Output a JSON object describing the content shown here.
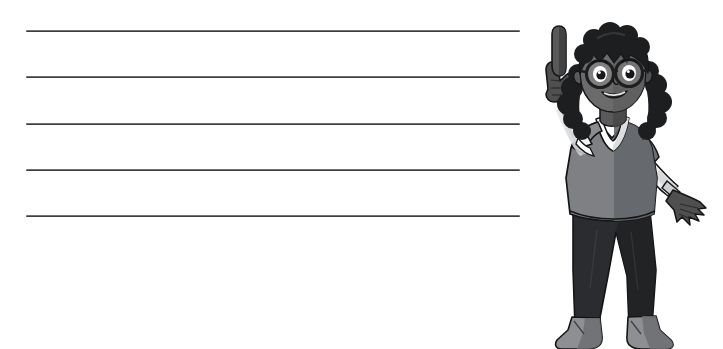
{
  "page": {
    "background_color": "#ffffff",
    "width": 723,
    "height": 349,
    "kind": "worksheet-writing-lines-with-character"
  },
  "worksheet": {
    "lines_label": "",
    "line_count": 5,
    "lines": [
      {
        "index": 1,
        "text": "",
        "y": 30
      },
      {
        "index": 2,
        "text": "",
        "y": 76
      },
      {
        "index": 3,
        "text": "",
        "y": 123
      },
      {
        "index": 4,
        "text": "",
        "y": 169
      },
      {
        "index": 5,
        "text": "",
        "y": 215
      }
    ],
    "line_color": "#3b3d41",
    "line_highlight_color": "#6f7175",
    "line_left": 26,
    "line_right": 520
  },
  "illustration": {
    "name": "girl-pointing-up",
    "alt_text": "",
    "colors": {
      "hair": "#1d1e20",
      "hair_shadow": "#111214",
      "skin": "#6b6b6b",
      "skin_shadow": "#4f4f4f",
      "skin_highlight": "#7e7e7e",
      "shirt": "#7e8084",
      "shirt_shadow": "#636569",
      "collar": "#ffffff",
      "collar_shadow": "#d9dadc",
      "sleeve_under": "#f2f2f2",
      "sleeve_under_shadow": "#cfd0d2",
      "pants": "#2b2c2f",
      "pants_shadow": "#1d1e20",
      "boots": "#8d8f93",
      "boots_shadow": "#6c6e72",
      "glasses": "#1d1e20",
      "lens": "#9a9a9a",
      "eye": "#16171a",
      "outline": "#141517"
    },
    "parts": [
      {
        "name": "hair",
        "label": "curly dark hair"
      },
      {
        "name": "face",
        "label": "smiling face"
      },
      {
        "name": "glasses",
        "label": "round eyeglasses"
      },
      {
        "name": "raised-hand",
        "label": "raised hand with index finger pointing up"
      },
      {
        "name": "tshirt",
        "label": "grey v-neck t-shirt with white collar trim"
      },
      {
        "name": "lowered-hand",
        "label": "lowered open hand"
      },
      {
        "name": "pants",
        "label": "dark slim jeans"
      },
      {
        "name": "boots",
        "label": "grey ankle boots"
      }
    ]
  }
}
